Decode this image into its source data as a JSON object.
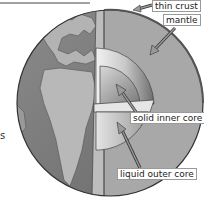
{
  "diagram": {
    "labels": {
      "crust": "thin crust",
      "mantle": "mantle",
      "inner_core": "solid inner core",
      "outer_core": "liquid outer core"
    },
    "edge_fragment": "s",
    "colors": {
      "ocean": "#7a7a7a",
      "land": "#b5b5b5",
      "mantle": "#a8a8a8",
      "outer_core": "#c4c4c4",
      "inner_core": "#8c8c8c",
      "outline": "#333333",
      "label_border": "#9a9a9a"
    }
  }
}
